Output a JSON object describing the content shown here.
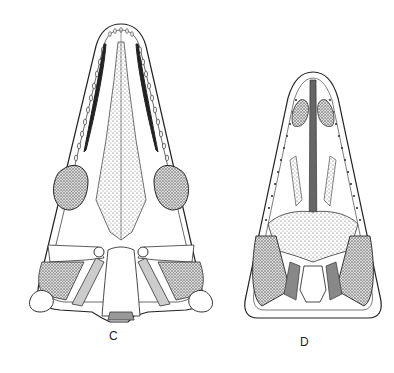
{
  "figure": {
    "type": "scientific illustration",
    "panels": [
      {
        "id": "C",
        "label": "C"
      },
      {
        "id": "D",
        "label": "D"
      }
    ],
    "colors": {
      "ink": "#222222",
      "stipple": "#8a8a8a",
      "background": "#ffffff"
    }
  }
}
